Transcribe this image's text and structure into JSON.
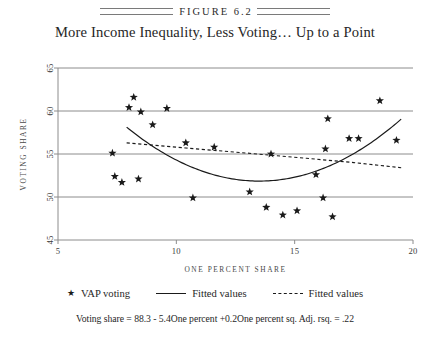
{
  "figure": {
    "label": "FIGURE 6.2",
    "title": "More Income Inequality, Less Voting… Up to a Point",
    "caption": "Voting share = 88.3 - 5.4One percent +0.2One percent sq.  Adj. rsq. = .22"
  },
  "legend": {
    "position": "below-axis",
    "items": [
      {
        "marker": "star-marker",
        "glyph": "★",
        "label": "VAP voting"
      },
      {
        "marker": "solid-line",
        "label": "Fitted values"
      },
      {
        "marker": "dashed-line",
        "label": "Fitted values"
      }
    ]
  },
  "colors": {
    "axis": "#8c8c8c",
    "grid": "#8c8c8c",
    "marker": "#1a1a1a",
    "fit_solid": "#1a1a1a",
    "fit_dashed": "#1a1a1a",
    "text": "#262626",
    "background": "#ffffff"
  },
  "chart_data": {
    "type": "scatter",
    "title": "More Income Inequality, Less Voting… Up to a Point",
    "xlabel": "ONE PERCENT SHARE",
    "ylabel": "VOTING SHARE",
    "xlim": [
      5,
      20
    ],
    "ylim": [
      45,
      65
    ],
    "xticks": [
      5,
      10,
      15,
      20
    ],
    "yticks": [
      45,
      50,
      55,
      60,
      65
    ],
    "xtick_labels": [
      "5",
      "10",
      "15",
      "20"
    ],
    "ytick_labels": [
      "45",
      "50",
      "55",
      "60",
      "65"
    ],
    "grid": "horizontal",
    "series": [
      {
        "name": "VAP voting",
        "type": "scatter",
        "marker": "star",
        "points": [
          {
            "x": 7.3,
            "y": 55.1
          },
          {
            "x": 7.4,
            "y": 52.4
          },
          {
            "x": 7.7,
            "y": 51.7
          },
          {
            "x": 8.0,
            "y": 60.4
          },
          {
            "x": 8.2,
            "y": 61.6
          },
          {
            "x": 8.4,
            "y": 52.1
          },
          {
            "x": 8.5,
            "y": 59.9
          },
          {
            "x": 9.0,
            "y": 58.4
          },
          {
            "x": 9.6,
            "y": 60.3
          },
          {
            "x": 10.4,
            "y": 56.3
          },
          {
            "x": 10.7,
            "y": 49.9
          },
          {
            "x": 11.6,
            "y": 55.8
          },
          {
            "x": 13.1,
            "y": 50.6
          },
          {
            "x": 13.8,
            "y": 48.8
          },
          {
            "x": 14.0,
            "y": 55.0
          },
          {
            "x": 14.5,
            "y": 47.9
          },
          {
            "x": 15.1,
            "y": 48.4
          },
          {
            "x": 15.9,
            "y": 52.6
          },
          {
            "x": 16.2,
            "y": 49.9
          },
          {
            "x": 16.3,
            "y": 55.6
          },
          {
            "x": 16.4,
            "y": 59.1
          },
          {
            "x": 16.6,
            "y": 47.7
          },
          {
            "x": 17.3,
            "y": 56.8
          },
          {
            "x": 17.7,
            "y": 56.8
          },
          {
            "x": 18.6,
            "y": 61.2
          },
          {
            "x": 19.3,
            "y": 56.6
          }
        ]
      },
      {
        "name": "Fitted values",
        "type": "line",
        "style": "solid",
        "equation": "88.3 - 5.4x + 0.2x^2",
        "xrange": [
          7.9,
          19.5
        ],
        "points": [
          {
            "x": 7.9,
            "y": 58.0
          },
          {
            "x": 9.0,
            "y": 55.9
          },
          {
            "x": 10.0,
            "y": 54.3
          },
          {
            "x": 11.0,
            "y": 53.1
          },
          {
            "x": 12.0,
            "y": 52.3
          },
          {
            "x": 13.0,
            "y": 51.9
          },
          {
            "x": 13.5,
            "y": 51.8
          },
          {
            "x": 14.0,
            "y": 51.9
          },
          {
            "x": 15.0,
            "y": 52.3
          },
          {
            "x": 16.0,
            "y": 53.1
          },
          {
            "x": 17.0,
            "y": 54.3
          },
          {
            "x": 18.0,
            "y": 55.9
          },
          {
            "x": 19.0,
            "y": 57.9
          },
          {
            "x": 19.5,
            "y": 59.0
          }
        ]
      },
      {
        "name": "Fitted values",
        "type": "line",
        "style": "dashed",
        "xrange": [
          7.9,
          19.5
        ],
        "points": [
          {
            "x": 7.9,
            "y": 56.3
          },
          {
            "x": 10.4,
            "y": 55.7
          },
          {
            "x": 13.0,
            "y": 55.1
          },
          {
            "x": 15.5,
            "y": 54.5
          },
          {
            "x": 17.5,
            "y": 54.0
          },
          {
            "x": 19.5,
            "y": 53.4
          }
        ]
      }
    ]
  }
}
